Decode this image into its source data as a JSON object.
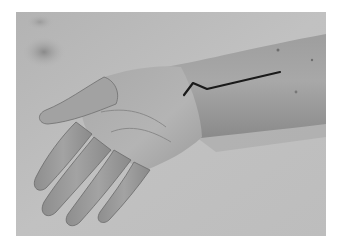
{
  "image": {
    "kind": "photograph",
    "subject": "hand-and-forearm-with-incision-marking",
    "colors": {
      "page_background": "#ffffff",
      "backdrop": "#b8b8b8",
      "backdrop_light": "#c4c4c4",
      "skin_light": "#b0b0b0",
      "skin_mid": "#9a9a9a",
      "skin_shadow": "#6e6e6e",
      "stain": "#8c8c8c",
      "incision_line": "#1a1a1a"
    },
    "incision_points": "168,83 177,71 191,77 264,60"
  }
}
